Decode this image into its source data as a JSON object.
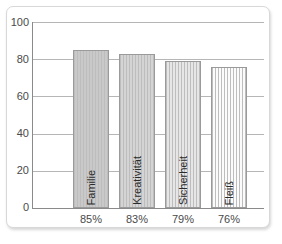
{
  "chart_data": {
    "type": "bar",
    "title": "",
    "xlabel": "",
    "ylabel": "",
    "ylim": [
      0,
      100
    ],
    "yticks": [
      0,
      20,
      40,
      60,
      80,
      100
    ],
    "grid": true,
    "legend": "none",
    "categories": [
      "Familie",
      "Kreativität",
      "Sicherheit",
      "Fleiß"
    ],
    "values": [
      85,
      83,
      79,
      76
    ],
    "tick_labels": [
      "85%",
      "83%",
      "79%",
      "76%"
    ],
    "bar_fills": [
      "#c9c9c9",
      "#d4d4d4",
      "#e6e6e6",
      "#fbfbfb"
    ],
    "bar_stripe": "#bdbdbd",
    "bar_border": "#9a9a9a",
    "axis_color": "#8a8a8a",
    "grid_color": "#b6b6b6",
    "text_color": "#4a4a4a"
  },
  "axis": {
    "y_labels": [
      "100",
      "80",
      "60",
      "40",
      "20",
      "0"
    ]
  }
}
